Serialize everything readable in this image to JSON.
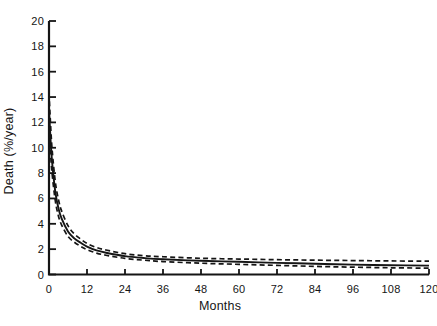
{
  "figure": {
    "background": "#ffffff",
    "ink_color": "#151515"
  },
  "chart_data": {
    "type": "line",
    "title": "",
    "xlabel": "Months",
    "ylabel": "Death (%/year)",
    "xlim": [
      0,
      120
    ],
    "ylim": [
      0,
      20
    ],
    "x_ticks": [
      0,
      12,
      24,
      36,
      48,
      60,
      72,
      84,
      96,
      108,
      120
    ],
    "y_ticks": [
      0,
      2,
      4,
      6,
      8,
      10,
      12,
      14,
      16,
      18,
      20
    ],
    "grid": false,
    "legend_position": "none",
    "x": [
      0,
      0.5,
      1,
      2,
      3,
      4,
      6,
      8,
      10,
      12,
      15,
      18,
      24,
      30,
      36,
      48,
      60,
      72,
      84,
      96,
      108,
      120
    ],
    "series": [
      {
        "name": "death-hazard",
        "style": "solid",
        "values": [
          13.0,
          10.6,
          8.8,
          6.5,
          5.2,
          4.4,
          3.4,
          2.85,
          2.5,
          2.2,
          1.9,
          1.72,
          1.45,
          1.3,
          1.2,
          1.08,
          1.0,
          0.92,
          0.85,
          0.78,
          0.73,
          0.7
        ]
      },
      {
        "name": "upper-confidence-band",
        "style": "dashed",
        "values": [
          14.3,
          11.8,
          9.8,
          7.3,
          5.9,
          5.0,
          3.85,
          3.2,
          2.8,
          2.45,
          2.13,
          1.93,
          1.64,
          1.48,
          1.4,
          1.28,
          1.22,
          1.17,
          1.13,
          1.1,
          1.07,
          1.05
        ]
      },
      {
        "name": "lower-confidence-band",
        "style": "dashed",
        "values": [
          11.8,
          9.5,
          7.9,
          5.8,
          4.6,
          3.9,
          3.0,
          2.55,
          2.22,
          1.96,
          1.69,
          1.52,
          1.27,
          1.13,
          1.02,
          0.89,
          0.8,
          0.72,
          0.64,
          0.58,
          0.53,
          0.5
        ]
      }
    ]
  }
}
